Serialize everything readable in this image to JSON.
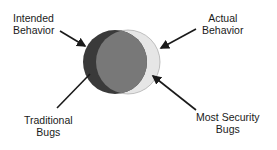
{
  "diagram": {
    "type": "venn",
    "sets": [
      {
        "id": "intended",
        "name": "Intended Behavior",
        "color": "#3c3c3c"
      },
      {
        "id": "actual",
        "name": "Actual Behavior",
        "color": "#e4e4e4"
      }
    ],
    "overlap_color": "#777777",
    "labels": {
      "intended": {
        "line1": "Intended",
        "line2": "Behavior"
      },
      "actual": {
        "line1": "Actual",
        "line2": "Behavior"
      },
      "traditional": {
        "line1": "Traditional",
        "line2": "Bugs"
      },
      "security": {
        "line1": "Most Security",
        "line2": "Bugs"
      }
    },
    "arrow_color": "#1a1a1a"
  }
}
